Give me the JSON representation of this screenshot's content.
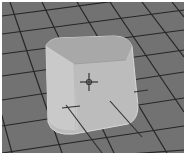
{
  "viewport": {
    "label": "3D viewport",
    "object": "rounded-cube",
    "colors": {
      "floor": "#6f6f6f",
      "grid": "#2a2a2a",
      "cube_front": "#bdbdbd",
      "cube_top": "#a9a9a9",
      "cube_side": "#c8c8c8",
      "pivot": "#333333"
    }
  }
}
